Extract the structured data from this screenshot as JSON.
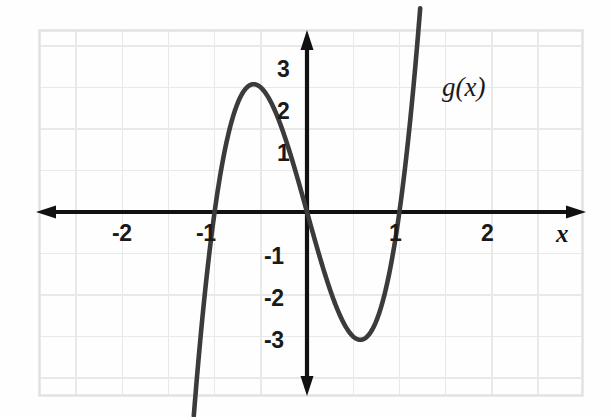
{
  "figure": {
    "kind": "coordinate-plane-graph",
    "background_color": "#fefefe",
    "frame_color": "#e2e2e2",
    "grid_color": "#e9e9e9",
    "axis_color": "#111111",
    "curve_color": "#3b3b3b"
  },
  "axes": {
    "x_axis_label": "x",
    "y_axis_label": "",
    "x_tick_labels": [
      "-2",
      "-1",
      "1",
      "2"
    ],
    "y_tick_labels": [
      "3",
      "2",
      "1",
      "-1",
      "-2",
      "-3"
    ]
  },
  "curve": {
    "label": "g(x)"
  },
  "chart_data": {
    "type": "line",
    "title": "",
    "subtitle": "",
    "xlabel": "x",
    "ylabel": "",
    "grid": true,
    "grid_step_x": 1,
    "grid_step_y": 1,
    "legend_position": "inline-annotation",
    "xlim": [
      -3.5,
      3.0
    ],
    "ylim": [
      -4.0,
      4.5
    ],
    "xticks": [
      -2,
      -1,
      1,
      2
    ],
    "xticklabels": [
      "-2",
      "-1",
      "1",
      "2"
    ],
    "yticks": [
      3,
      2,
      1,
      -1,
      -2,
      -3
    ],
    "yticklabels": [
      "3",
      "2",
      "1",
      "-1",
      "-2",
      "-3"
    ],
    "annotations": [
      {
        "text": "g(x)",
        "x": 1.75,
        "y": 3.0
      }
    ],
    "series": [
      {
        "name": "g(x)",
        "equation": "x^3 - 4x",
        "color": "#3b3b3b",
        "x": [
          -2.3,
          -2.2,
          -2.1,
          -2.0,
          -1.9,
          -1.8,
          -1.7,
          -1.6,
          -1.5,
          -1.4,
          -1.3,
          -1.2,
          -1.15,
          -1.1,
          -1.0,
          -0.9,
          -0.8,
          -0.7,
          -0.6,
          -0.5,
          -0.4,
          -0.3,
          -0.2,
          -0.1,
          0.0,
          0.1,
          0.2,
          0.3,
          0.4,
          0.5,
          0.6,
          0.7,
          0.8,
          0.9,
          1.0,
          1.1,
          1.15,
          1.2,
          1.3,
          1.4,
          1.5,
          1.6,
          1.7,
          1.8,
          1.9,
          2.0,
          2.1,
          2.2,
          2.3,
          2.4
        ],
        "y": [
          -2.97,
          -2.85,
          -2.66,
          -2.4,
          -2.06,
          -1.63,
          -1.11,
          -0.5,
          0.2,
          0.86,
          1.33,
          3.07,
          3.08,
          3.07,
          3.0,
          2.87,
          2.69,
          2.46,
          2.18,
          1.88,
          1.54,
          1.17,
          0.79,
          0.4,
          0.0,
          -0.4,
          -0.79,
          -1.17,
          -1.54,
          -1.88,
          -2.18,
          -2.46,
          -2.69,
          -2.87,
          -3.0,
          -3.07,
          -3.08,
          -3.07,
          -2.8,
          -2.86,
          -2.63,
          -2.3,
          -1.89,
          -1.37,
          -0.74,
          0.0,
          0.86,
          1.85,
          2.97,
          4.22
        ]
      }
    ],
    "key_points": {
      "roots": [
        -2,
        0,
        2
      ],
      "local_maximum": {
        "x": -1.15,
        "y": 3.08
      },
      "local_minimum": {
        "x": 1.15,
        "y": -3.08
      },
      "inflection": {
        "x": 0,
        "y": 0
      }
    }
  }
}
